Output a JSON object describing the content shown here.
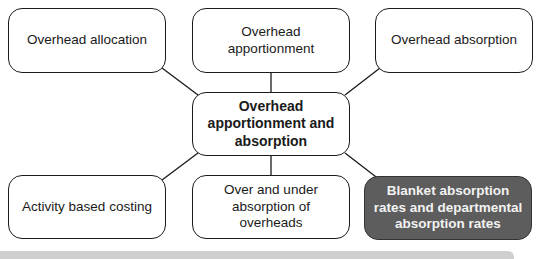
{
  "diagram": {
    "center": {
      "label": "Overhead apportionment and absorption"
    },
    "nodes": [
      {
        "id": "allocation",
        "label": "Overhead allocation"
      },
      {
        "id": "apportionment",
        "label": "Overhead apportionment"
      },
      {
        "id": "absorption",
        "label": "Overhead absorption"
      },
      {
        "id": "abc",
        "label": "Activity based costing"
      },
      {
        "id": "over-under",
        "label": "Over and under absorption of overheads"
      },
      {
        "id": "blanket",
        "label": "Blanket absorption rates and departmental absorption rates",
        "highlighted": true
      }
    ],
    "colors": {
      "highlight_fill": "#5d5d5d",
      "highlight_text": "#f2f2f2",
      "border": "#1a1a1a",
      "footer_bar": "#cfcfcf"
    }
  }
}
